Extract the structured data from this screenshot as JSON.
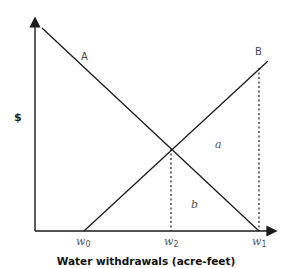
{
  "diagram": {
    "y_axis_label": "$",
    "x_axis_title": "Water withdrawals (acre-feet)",
    "curves": [
      {
        "name": "A",
        "label": "A",
        "slope": "downward",
        "from": [
          42,
          28
        ],
        "to": [
          259,
          231
        ]
      },
      {
        "name": "B",
        "label": "B",
        "slope": "upward",
        "from": [
          84,
          231
        ],
        "to": [
          268,
          61
        ]
      }
    ],
    "regions": [
      {
        "name": "a",
        "label": "a"
      },
      {
        "name": "b",
        "label": "b"
      }
    ],
    "x_ticks": [
      {
        "name": "w0",
        "base": "w",
        "sub": "0",
        "x": 83
      },
      {
        "name": "w2",
        "base": "w",
        "sub": "2",
        "x": 171
      },
      {
        "name": "w1",
        "base": "w",
        "sub": "1",
        "x": 259
      }
    ],
    "intersection": [
      171,
      149
    ],
    "colors": {
      "line": "#1a1a1a",
      "text": "#3a3a3a"
    }
  }
}
